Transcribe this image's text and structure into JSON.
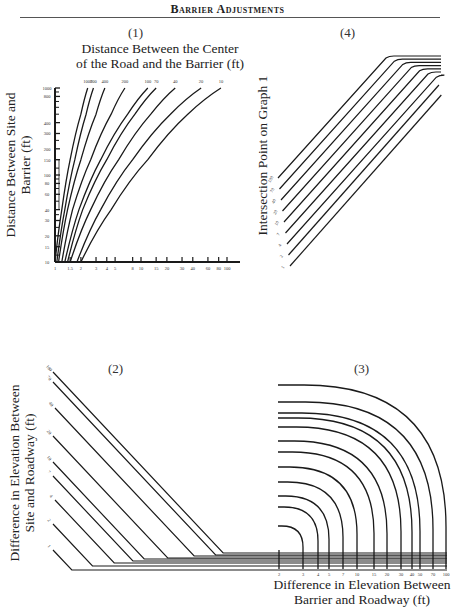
{
  "page": {
    "title": "Barrier Adjustments"
  },
  "panels": {
    "p1": {
      "number": "(1)",
      "top_title_line1": "Distance Between the Center",
      "top_title_line2": "of the Road and the Barrier (ft)",
      "y_title_line1": "Distance Between Site and",
      "y_title_line2": "Barrier (ft)"
    },
    "p4": {
      "number": "(4)",
      "y_title": "Intersection Point on Graph 1"
    },
    "p2": {
      "number": "(2)",
      "y_title_line1": "Difference in Elevation Between",
      "y_title_line2": "Site and Roadway (ft)"
    },
    "p3": {
      "number": "(3)",
      "x_title_line1": "Difference in Elevation Between",
      "x_title_line2": "Barrier and Roadway (ft)"
    }
  },
  "colors": {
    "ink": "#1a1a1a",
    "background": "#ffffff"
  },
  "chart_data": [
    {
      "id": "graph-1",
      "type": "line",
      "title": "(1)",
      "xlabel": "",
      "ylabel": "Distance Between Site and Barrier (ft)",
      "top_label": "Distance Between the Center of the Road and the Barrier (ft)",
      "x_scale": "log",
      "y_scale": "log",
      "x_ticks": [
        "1",
        "1.5",
        "2",
        "3",
        "4",
        "5",
        "8",
        "10",
        "15",
        "20",
        "30",
        "40",
        "60",
        "80",
        "100"
      ],
      "y_ticks": [
        "10",
        "15",
        "20",
        "30",
        "40",
        "60",
        "80",
        "100",
        "150",
        "200",
        "300",
        "400",
        "800",
        "1000"
      ],
      "xlim": [
        1,
        100
      ],
      "ylim": [
        10,
        1000
      ],
      "series_labels": [
        "1000",
        "700",
        "400",
        "200",
        "100",
        "70",
        "40",
        "20",
        "10"
      ],
      "series": [
        {
          "name": "1000",
          "x": [
            1.0,
            1.2,
            1.5,
            2.0,
            2.4
          ],
          "y": [
            10,
            40,
            150,
            500,
            1000
          ]
        },
        {
          "name": "700",
          "x": [
            1.05,
            1.3,
            1.7,
            2.3,
            2.8
          ],
          "y": [
            10,
            40,
            150,
            500,
            1000
          ]
        },
        {
          "name": "400",
          "x": [
            1.1,
            1.4,
            2.0,
            3.0,
            3.8
          ],
          "y": [
            10,
            40,
            150,
            500,
            1000
          ]
        },
        {
          "name": "200",
          "x": [
            1.2,
            1.6,
            2.6,
            4.5,
            6.5
          ],
          "y": [
            10,
            40,
            150,
            500,
            1000
          ]
        },
        {
          "name": "100",
          "x": [
            1.3,
            1.9,
            3.4,
            7.0,
            12
          ],
          "y": [
            10,
            40,
            150,
            500,
            1000
          ]
        },
        {
          "name": "70",
          "x": [
            1.4,
            2.1,
            4.0,
            8.5,
            15
          ],
          "y": [
            10,
            40,
            150,
            500,
            1000
          ]
        },
        {
          "name": "40",
          "x": [
            1.5,
            2.6,
            5.5,
            13,
            25
          ],
          "y": [
            10,
            40,
            150,
            500,
            1000
          ]
        },
        {
          "name": "20",
          "x": [
            1.8,
            3.4,
            8.0,
            22,
            50
          ],
          "y": [
            10,
            40,
            150,
            500,
            1000
          ]
        },
        {
          "name": "10",
          "x": [
            2.0,
            4.5,
            12,
            35,
            85
          ],
          "y": [
            10,
            40,
            150,
            500,
            1000
          ]
        }
      ],
      "grid": false
    },
    {
      "id": "graph-4",
      "type": "line",
      "title": "(4)",
      "ylabel": "Intersection Point on Graph 1",
      "series_labels": [
        "100",
        "70",
        "40",
        "20",
        "10",
        "7",
        "4",
        "2",
        "1"
      ],
      "description": "Parallel diagonal lines rising to the right, each bending to a horizontal plateau at the top right; higher-labelled lines plateau higher",
      "grid": false
    },
    {
      "id": "graph-2",
      "type": "line",
      "title": "(2)",
      "ylabel": "Difference in Elevation Between Site and Roadway (ft)",
      "series_labels": [
        "100",
        "70",
        "40",
        "20",
        "10",
        "7",
        "4",
        "2",
        "1"
      ],
      "description": "Parallel diagonal lines descending to the right, each turning horizontal near the bottom right",
      "grid": false
    },
    {
      "id": "graph-3",
      "type": "line",
      "title": "(3)",
      "xlabel": "Difference in Elevation Between Barrier and Roadway (ft)",
      "x_ticks": [
        "2",
        "3",
        "4",
        "5",
        "7",
        "10",
        "15",
        "20",
        "30",
        "40",
        "50",
        "70",
        "100"
      ],
      "description": "Nested quarter-circle style curves: horizontal at left, bending down to vertical at each x tick; the 2 ft line is a short vertical stub",
      "grid": false
    }
  ]
}
